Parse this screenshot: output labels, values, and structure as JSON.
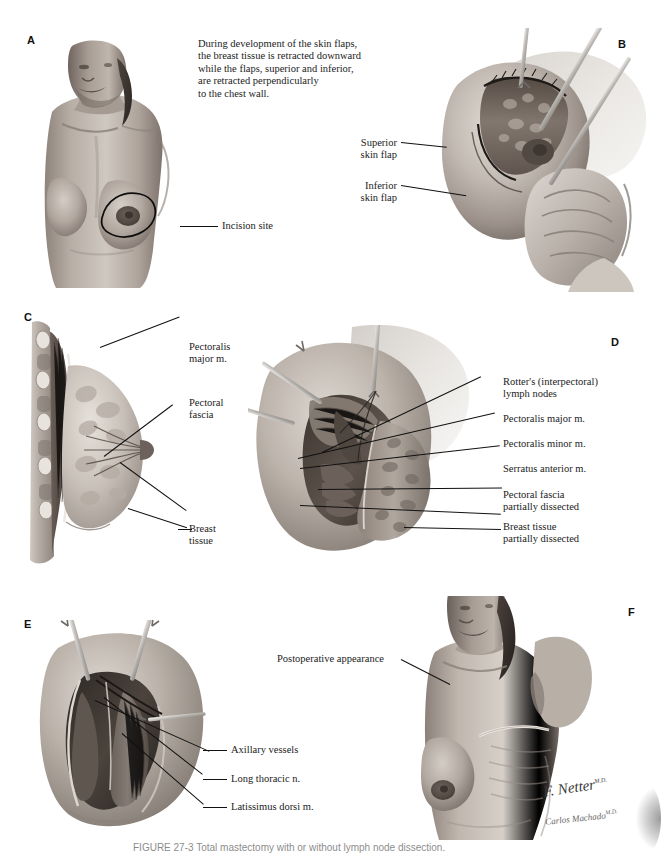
{
  "figure": {
    "caption_text": "FIGURE 27-3  Total mastectomy with or without lymph node dissection.",
    "signature_primary": "F. Netter",
    "signature_primary_suffix": "M.D.",
    "signature_secondary": "Carlos Machado",
    "signature_secondary_suffix": "M.D."
  },
  "panels": {
    "a": {
      "letter": "A",
      "intro_text": "During development of the skin flaps,\nthe breast tissue is retracted downward\nwhile the flaps, superior and inferior,\nare retracted perpendicularly\nto the chest wall.",
      "labels": [
        {
          "text": "Incision site"
        }
      ]
    },
    "b": {
      "letter": "B",
      "labels": [
        {
          "text": "Superior\nskin flap"
        },
        {
          "text": "Inferior\nskin flap"
        }
      ]
    },
    "c": {
      "letter": "C",
      "labels": [
        {
          "text": "Pectoralis\nmajor m."
        },
        {
          "text": "Pectoral\nfascia"
        },
        {
          "text": "Breast\ntissue"
        }
      ]
    },
    "d": {
      "letter": "D",
      "labels": [
        {
          "text": "Rotter's (interpectoral)\nlymph nodes"
        },
        {
          "text": "Pectoralis major m."
        },
        {
          "text": "Pectoralis minor m."
        },
        {
          "text": "Serratus anterior m."
        },
        {
          "text": "Pectoral fascia\npartially dissected"
        },
        {
          "text": "Breast tissue\npartially dissected"
        }
      ]
    },
    "e": {
      "letter": "E",
      "labels": [
        {
          "text": "Axillary vessels"
        },
        {
          "text": "Long thoracic n."
        },
        {
          "text": "Latissimus dorsi m."
        }
      ]
    },
    "f": {
      "letter": "F",
      "labels": [
        {
          "text": "Postoperative appearance"
        }
      ]
    }
  },
  "colors": {
    "ink": "#141414",
    "leader": "#111111",
    "paper": "#ffffff",
    "skin_light": "#d8d2cc",
    "skin_mid": "#a89d94",
    "skin_dark": "#6d635c",
    "tissue_dark": "#4a4views"
  }
}
